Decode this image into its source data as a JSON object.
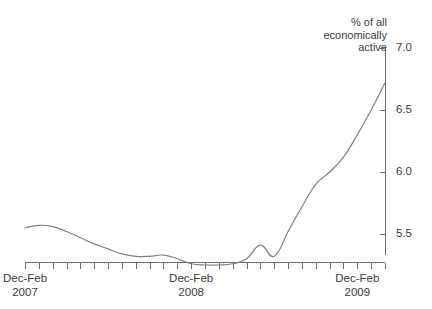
{
  "chart_data": {
    "type": "line",
    "title": "",
    "subtitle": "",
    "ylabel": "% of all\neconomically\nactive",
    "xlabel": "",
    "ylim": [
      5.0,
      7.0
    ],
    "yticks": [
      5.5,
      6.0,
      6.5,
      7.0
    ],
    "ytick_labels": [
      "5.5",
      "6.0",
      "6.5",
      "7.0"
    ],
    "grid": false,
    "legend": null,
    "axis_position": "right",
    "x_tick_count": 27,
    "xtick_labels": [
      {
        "line1": "Dec-Feb",
        "line2": "2007",
        "index": 0
      },
      {
        "line1": "Dec-Feb",
        "line2": "2008",
        "index": 12
      },
      {
        "line1": "Dec-Feb",
        "line2": "2009",
        "index": 24
      }
    ],
    "series": [
      {
        "name": "Unemployment rate",
        "color": "#808080",
        "x": [
          "Dec-Feb 2007",
          "Jan-Mar 2007",
          "Feb-Apr 2007",
          "Mar-May 2007",
          "Apr-Jun 2007",
          "May-Jul 2007",
          "Jun-Aug 2007",
          "Jul-Sep 2007",
          "Aug-Oct 2007",
          "Sep-Nov 2007",
          "Oct-Dec 2007",
          "Nov-Jan 2008",
          "Dec-Feb 2008",
          "Jan-Mar 2008",
          "Feb-Apr 2008",
          "Mar-May 2008",
          "Apr-Jun 2008",
          "May-Jul 2008",
          "Jun-Aug 2008",
          "Jul-Sep 2008",
          "Aug-Oct 2008",
          "Sep-Nov 2008",
          "Oct-Dec 2008",
          "Nov-Jan 2009",
          "Dec-Feb 2009",
          "Jan-Mar 2009",
          "Feb-Apr 2009"
        ],
        "values": [
          5.55,
          5.57,
          5.56,
          5.52,
          5.47,
          5.42,
          5.38,
          5.34,
          5.32,
          5.32,
          5.33,
          5.3,
          5.26,
          5.25,
          5.25,
          5.26,
          5.3,
          5.41,
          5.32,
          5.52,
          5.72,
          5.9,
          6.0,
          6.12,
          6.3,
          6.5,
          6.72
        ]
      }
    ]
  }
}
